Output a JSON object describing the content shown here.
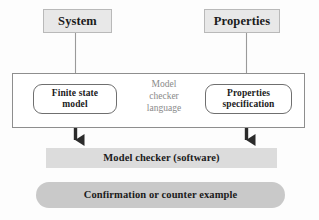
{
  "diagram": {
    "colors": {
      "source_box_fill": "#e8e8e8",
      "source_box_border": "#b9b9b9",
      "container_border": "#8e8e8e",
      "round_box_fill": "#ffffff",
      "round_box_border": "#6f6f6f",
      "checker_fill": "#dcdcdc",
      "result_fill": "#c9c9c9",
      "text_dark": "#1b1b1b",
      "text_gray": "#8a8a8a",
      "thin_arrow": "#9a9a9a",
      "thick_arrow": "#2b2b2b"
    },
    "nodes": {
      "system": {
        "label": "System",
        "shape": "rectangle"
      },
      "properties": {
        "label": "Properties",
        "shape": "rectangle"
      },
      "finite_state_model": {
        "label": "Finite state\nmodel",
        "shape": "rounded-rectangle"
      },
      "properties_specification": {
        "label": "Properties\nspecification",
        "shape": "rounded-rectangle"
      },
      "model_checker_language": {
        "label": "Model\nchecker\nlanguage",
        "shape": "text"
      },
      "model_checker_software": {
        "label": "Model checker (software)",
        "shape": "rectangle"
      },
      "result": {
        "label": "Confirmation or counter example",
        "shape": "rounded-rectangle"
      }
    },
    "edges": [
      {
        "name": "system-to-finite-state-model",
        "from": "system",
        "to": "finite_state_model",
        "style": "thin"
      },
      {
        "name": "properties-to-properties-specification",
        "from": "properties",
        "to": "properties_specification",
        "style": "thin"
      },
      {
        "name": "finite-state-model-to-model-checker",
        "from": "finite_state_model",
        "to": "model_checker_software",
        "style": "thick"
      },
      {
        "name": "properties-specification-to-model-checker",
        "from": "properties_specification",
        "to": "model_checker_software",
        "style": "thick"
      }
    ]
  }
}
